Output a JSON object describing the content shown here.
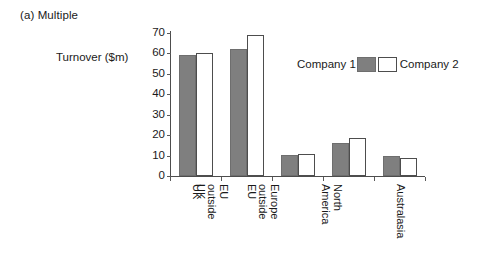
{
  "figure": {
    "caption": "(a) Multiple"
  },
  "legend": {
    "position": "top-right-inside",
    "entries": [
      {
        "label": "Company 1",
        "swatch": "gray-swatch",
        "color": "#7f7f7f"
      },
      {
        "label": "Company 2",
        "swatch": "white-swatch",
        "color": "#ffffff"
      }
    ]
  },
  "chart_data": {
    "type": "bar",
    "title": "(a) Multiple",
    "xlabel": "",
    "ylabel": "Turnover ($m)",
    "categories": [
      "UK",
      "EU outside UK",
      "Europe outside EU",
      "North America",
      "Australasia"
    ],
    "category_lines": [
      [
        "UK"
      ],
      [
        "EU",
        "outside",
        "UK"
      ],
      [
        "Europe",
        "outside",
        "EU"
      ],
      [
        "North",
        "America"
      ],
      [
        "Australasia"
      ]
    ],
    "series": [
      {
        "name": "Company 1",
        "color": "#7f7f7f",
        "values": [
          59,
          62,
          10.5,
          16,
          10
        ]
      },
      {
        "name": "Company 2",
        "color": "#ffffff",
        "values": [
          60,
          69,
          11,
          18.5,
          9
        ]
      }
    ],
    "ylim": [
      0,
      70
    ],
    "yticks": [
      0,
      10,
      20,
      30,
      40,
      50,
      60,
      70
    ],
    "ytick_labels": [
      "0",
      "10",
      "20",
      "30",
      "40",
      "50",
      "60",
      "70"
    ],
    "grid": false,
    "legend_position": "upper right"
  }
}
